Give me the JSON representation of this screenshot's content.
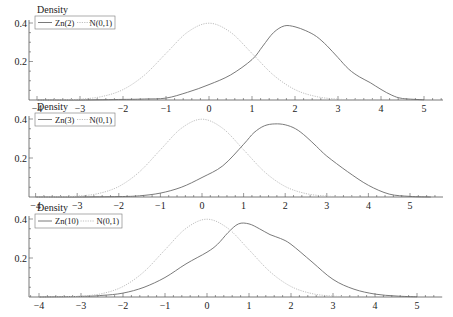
{
  "colors": {
    "zn": "#6b6b6b",
    "normal": "#b8b8b8",
    "axis": "#555555",
    "legend_border": "#777777"
  },
  "chart_data": [
    {
      "type": "line",
      "title": "",
      "ylabel": "Density",
      "xlabel": "",
      "xticks": [
        -4,
        -3,
        -2,
        -1,
        0,
        1,
        2,
        3,
        4,
        5
      ],
      "yticks": [
        0.2,
        0.4
      ],
      "xlim": [
        -4.2,
        5.5
      ],
      "ylim": [
        0,
        0.42
      ],
      "legend": [
        "Zn(2)",
        "N(0,1)"
      ],
      "legend_position": "top-left",
      "series": [
        {
          "name": "Zn(2)",
          "style": "solid",
          "x": [
            -4,
            -3,
            -2,
            -1.5,
            -1,
            -0.5,
            0,
            0.5,
            1,
            1.25,
            1.5,
            1.75,
            2,
            2.25,
            2.5,
            2.75,
            3,
            3.25,
            3.5,
            3.75,
            4,
            4.25,
            4.5,
            5
          ],
          "y": [
            0,
            0,
            0.003,
            0.005,
            0.01,
            0.04,
            0.08,
            0.13,
            0.21,
            0.28,
            0.35,
            0.385,
            0.38,
            0.36,
            0.33,
            0.28,
            0.22,
            0.16,
            0.12,
            0.09,
            0.055,
            0.025,
            0.008,
            0.001
          ]
        },
        {
          "name": "N(0,1)",
          "style": "dotted",
          "x": [
            -4,
            -3.5,
            -3,
            -2.5,
            -2,
            -1.5,
            -1,
            -0.5,
            0,
            0.5,
            1,
            1.5,
            2,
            2.5,
            3,
            3.5,
            4
          ],
          "y": [
            0.0001,
            0.0009,
            0.0044,
            0.0175,
            0.054,
            0.1295,
            0.242,
            0.352,
            0.399,
            0.352,
            0.242,
            0.1295,
            0.054,
            0.0175,
            0.0044,
            0.0009,
            0.0001
          ]
        }
      ]
    },
    {
      "type": "line",
      "title": "",
      "ylabel": "Density",
      "xlabel": "",
      "xticks": [
        -4,
        -3,
        -2,
        -1,
        0,
        1,
        2,
        3,
        4,
        5
      ],
      "yticks": [
        0.2,
        0.4
      ],
      "xlim": [
        -4.3,
        5.8
      ],
      "ylim": [
        0,
        0.42
      ],
      "legend": [
        "Zn(3)",
        "N(0,1)"
      ],
      "legend_position": "top-left",
      "series": [
        {
          "name": "Zn(3)",
          "style": "solid",
          "x": [
            -4,
            -3,
            -2,
            -1.5,
            -1,
            -0.5,
            0,
            0.5,
            1,
            1.25,
            1.5,
            1.75,
            2,
            2.25,
            2.5,
            2.75,
            3,
            3.5,
            4,
            4.5,
            5,
            5.5
          ],
          "y": [
            0,
            0,
            0.002,
            0.006,
            0.02,
            0.05,
            0.1,
            0.16,
            0.27,
            0.33,
            0.365,
            0.375,
            0.37,
            0.35,
            0.31,
            0.26,
            0.21,
            0.13,
            0.06,
            0.015,
            0.003,
            0
          ]
        },
        {
          "name": "N(0,1)",
          "style": "dotted",
          "x": [
            -4,
            -3.5,
            -3,
            -2.5,
            -2,
            -1.5,
            -1,
            -0.5,
            0,
            0.5,
            1,
            1.5,
            2,
            2.5,
            3,
            3.5,
            4
          ],
          "y": [
            0.0001,
            0.0009,
            0.0044,
            0.0175,
            0.054,
            0.1295,
            0.242,
            0.352,
            0.399,
            0.352,
            0.242,
            0.1295,
            0.054,
            0.0175,
            0.0044,
            0.0009,
            0.0001
          ]
        }
      ]
    },
    {
      "type": "line",
      "title": "",
      "ylabel": "Density",
      "xlabel": "",
      "xticks": [
        -4,
        -3,
        -2,
        -1,
        0,
        1,
        2,
        3,
        4,
        5
      ],
      "yticks": [
        0.2,
        0.4
      ],
      "xlim": [
        -4.3,
        5.6
      ],
      "ylim": [
        0,
        0.42
      ],
      "legend": [
        "Zn(10)",
        "N(0,1)"
      ],
      "legend_position": "top-left",
      "series": [
        {
          "name": "Zn(10)",
          "style": "solid",
          "x": [
            -4,
            -3,
            -2.5,
            -2,
            -1.5,
            -1,
            -0.5,
            0,
            0.25,
            0.5,
            0.75,
            1,
            1.25,
            1.5,
            1.75,
            2,
            2.5,
            3,
            3.5,
            4,
            4.5,
            5
          ],
          "y": [
            0,
            0.003,
            0.008,
            0.02,
            0.05,
            0.1,
            0.17,
            0.23,
            0.27,
            0.33,
            0.375,
            0.375,
            0.35,
            0.32,
            0.3,
            0.27,
            0.18,
            0.09,
            0.04,
            0.015,
            0.005,
            0.001
          ]
        },
        {
          "name": "N(0,1)",
          "style": "dotted",
          "x": [
            -4,
            -3.5,
            -3,
            -2.5,
            -2,
            -1.5,
            -1,
            -0.5,
            0,
            0.5,
            1,
            1.5,
            2,
            2.5,
            3,
            3.5,
            4
          ],
          "y": [
            0.0001,
            0.0009,
            0.0044,
            0.0175,
            0.054,
            0.1295,
            0.242,
            0.352,
            0.399,
            0.352,
            0.242,
            0.1295,
            0.054,
            0.0175,
            0.0044,
            0.0009,
            0.0001
          ]
        }
      ]
    }
  ],
  "layout": {
    "panels": [
      {
        "x0_px": 209,
        "unit_px": 43.0,
        "base_py": 100,
        "y04_py": 23,
        "yaxis_px": 29,
        "xaxis_end_px": 443,
        "legend": {
          "x": 35,
          "y": 16,
          "w": 80,
          "h": 13
        },
        "ylabel_pos": [
          37,
          13
        ]
      },
      {
        "x0_px": 202,
        "unit_px": 41.6,
        "base_py": 197,
        "y04_py": 119,
        "yaxis_px": 29,
        "xaxis_end_px": 443,
        "legend": {
          "x": 35,
          "y": 113,
          "w": 80,
          "h": 13
        },
        "ylabel_pos": [
          37,
          110
        ]
      },
      {
        "x0_px": 207,
        "unit_px": 42.0,
        "base_py": 297,
        "y04_py": 219,
        "yaxis_px": 29,
        "xaxis_end_px": 443,
        "legend": {
          "x": 35,
          "y": 214,
          "w": 87,
          "h": 14
        },
        "ylabel_pos": [
          37,
          211
        ]
      }
    ]
  }
}
